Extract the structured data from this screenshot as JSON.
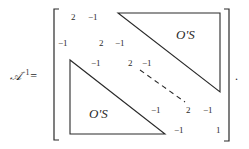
{
  "equation": {
    "lhs_symbol": "𝒜",
    "lhs_exponent": "−1",
    "equals": "=",
    "terminal_punctuation": "."
  },
  "matrix": {
    "rows": [
      {
        "entries": [
          "2",
          "−1"
        ]
      },
      {
        "entries": [
          "−1",
          "2",
          "−1"
        ]
      },
      {
        "entries": [
          "−1",
          "2",
          "−1"
        ]
      },
      {
        "entries": [
          "−1",
          "2",
          "−1"
        ]
      },
      {
        "entries": [
          "−1",
          "1"
        ]
      }
    ],
    "upper_block_label": "O'S",
    "lower_block_label": "O'S",
    "diagonal_continuation": "dashed"
  }
}
